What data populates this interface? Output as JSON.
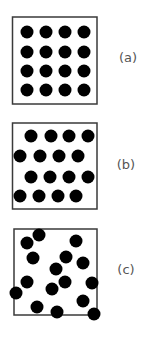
{
  "panels": [
    {
      "label": "(a)",
      "arrangement": "square lattice 4x4",
      "box": {
        "x": 12.5,
        "y": 17,
        "w": 84.5,
        "h": 87
      },
      "label_pos": {
        "x": 128,
        "y": 62
      },
      "dots": [
        [
          27,
          32
        ],
        [
          46,
          32
        ],
        [
          65,
          32
        ],
        [
          84,
          32
        ],
        [
          27,
          52
        ],
        [
          46,
          52
        ],
        [
          65,
          52
        ],
        [
          84,
          52
        ],
        [
          27,
          71
        ],
        [
          46,
          71
        ],
        [
          65,
          71
        ],
        [
          84,
          71
        ],
        [
          27,
          90
        ],
        [
          46,
          90
        ],
        [
          65,
          90
        ],
        [
          84,
          90
        ]
      ]
    },
    {
      "label": "(b)",
      "arrangement": "staggered rows",
      "box": {
        "x": 12.5,
        "y": 123,
        "w": 84.5,
        "h": 86
      },
      "label_pos": {
        "x": 126,
        "y": 169
      },
      "dots": [
        [
          31,
          136
        ],
        [
          51,
          136
        ],
        [
          69,
          136
        ],
        [
          88,
          136
        ],
        [
          20,
          156
        ],
        [
          40,
          156
        ],
        [
          59,
          156
        ],
        [
          78,
          156
        ],
        [
          31,
          177
        ],
        [
          50,
          177
        ],
        [
          69,
          177
        ],
        [
          88,
          177
        ],
        [
          20,
          196
        ],
        [
          39,
          196
        ],
        [
          58,
          196
        ],
        [
          76,
          196
        ]
      ]
    },
    {
      "label": "(c)",
      "arrangement": "random",
      "box": {
        "x": 14,
        "y": 229,
        "w": 83,
        "h": 86
      },
      "label_pos": {
        "x": 126,
        "y": 274
      },
      "dots": [
        [
          39,
          235
        ],
        [
          27,
          243
        ],
        [
          76,
          241
        ],
        [
          33,
          258
        ],
        [
          66,
          257
        ],
        [
          83,
          263
        ],
        [
          56,
          269
        ],
        [
          27,
          282
        ],
        [
          65,
          282
        ],
        [
          92,
          283
        ],
        [
          52,
          289
        ],
        [
          16,
          293
        ],
        [
          83,
          301
        ],
        [
          37,
          307
        ],
        [
          57,
          312
        ],
        [
          94,
          314
        ]
      ]
    }
  ],
  "dot_radius": 6.5,
  "colors": {
    "dot": "#000000",
    "box_stroke": "#3a3a3a",
    "label": "#555555"
  }
}
